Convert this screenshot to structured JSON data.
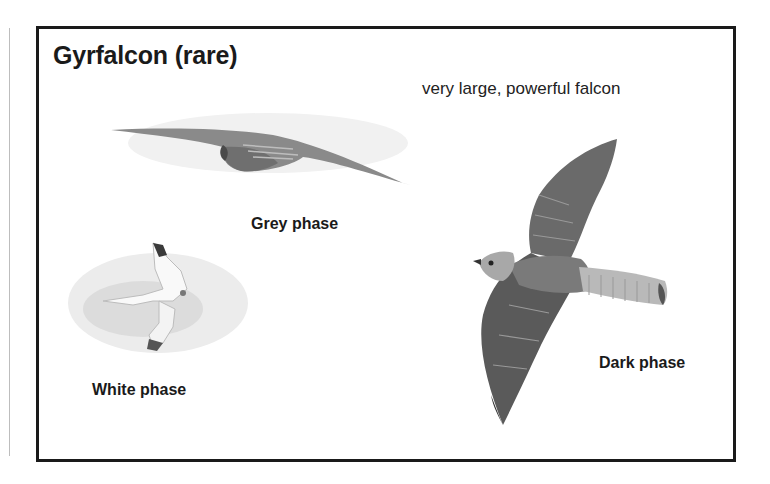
{
  "page": {
    "title": "Gyrfalcon (rare)",
    "description": "very large, powerful falcon"
  },
  "illustrations": [
    {
      "id": "grey",
      "label": "Grey phase",
      "icon": "falcon-grey-phase-illustration"
    },
    {
      "id": "white",
      "label": "White phase",
      "icon": "falcon-white-phase-illustration"
    },
    {
      "id": "dark",
      "label": "Dark phase",
      "icon": "falcon-dark-phase-illustration"
    }
  ],
  "colors": {
    "frame": "#1a1a1a",
    "text": "#1a1a1a",
    "grey_phase": "#8a8a8a",
    "white_phase": "#d8d8d8",
    "dark_phase": "#5e5e5e"
  }
}
